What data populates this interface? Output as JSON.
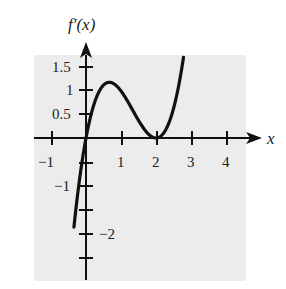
{
  "chart_data": {
    "type": "line",
    "title": "",
    "ylabel": "f′(x)",
    "xlabel": "x",
    "function_description": "f'(x) ≈ x(x−2)^2; zero at x=0, local max ≈1.15 at x≈0.67, double root (tangent to axis) at x=2",
    "xlim": [
      -1.5,
      4.5
    ],
    "ylim": [
      -2.9,
      1.8
    ],
    "x_ticks": [
      -1,
      0,
      1,
      2,
      3,
      4
    ],
    "x_tick_labels": [
      "−1",
      "",
      "1",
      "2",
      "3",
      "4"
    ],
    "y_ticks": [
      -2.5,
      -2,
      -1.5,
      -1,
      -0.5,
      0.5,
      1,
      1.5
    ],
    "y_tick_labels": [
      "",
      "−2",
      "",
      "−1",
      "",
      "0.5",
      "1",
      "1.5"
    ],
    "grid": false,
    "series": [
      {
        "name": "f'(x)",
        "x": [
          -0.35,
          -0.2,
          0,
          0.25,
          0.5,
          0.667,
          0.9,
          1.2,
          1.5,
          1.8,
          2,
          2.2,
          2.5,
          2.75
        ],
        "values": [
          -1.99,
          -0.97,
          0,
          0.77,
          1.13,
          1.19,
          1.07,
          0.77,
          0.38,
          0.07,
          0,
          0.09,
          0.63,
          1.55
        ]
      }
    ]
  },
  "labels": {
    "ylabel": "f′(x)",
    "xlabel": "x",
    "x_minus1": "−1",
    "x_1": "1",
    "x_2": "2",
    "x_3": "3",
    "x_4": "4",
    "y_1_5": "1.5",
    "y_1": "1",
    "y_0_5": "0.5",
    "y_minus1": "−1",
    "y_minus2": "−2"
  },
  "colors": {
    "background_panel": "#ececec",
    "curve": "#111111",
    "axis": "#111111"
  }
}
